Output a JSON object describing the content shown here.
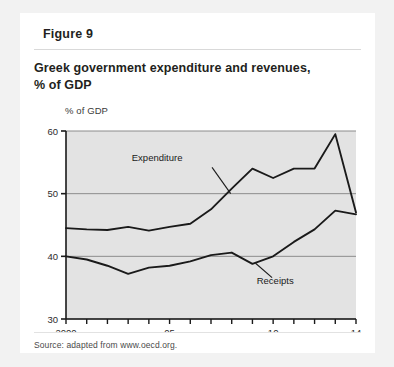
{
  "figure": {
    "tab_label": "Figure 9",
    "title_line1": "Greek government expenditure and revenues,",
    "title_line2": "% of GDP",
    "source": "Source: adapted from www.oecd.org."
  },
  "chart_data": {
    "type": "line",
    "title": "Greek government expenditure and revenues, % of GDP",
    "ylabel": "% of GDP",
    "xlabel": "",
    "ylim": [
      30,
      60
    ],
    "yticks": [
      30,
      40,
      50,
      60
    ],
    "ytick_labels": [
      "30",
      "40",
      "50",
      "60"
    ],
    "xlim": [
      2000,
      2014
    ],
    "xticks": [
      2000,
      2001,
      2002,
      2003,
      2004,
      2005,
      2006,
      2007,
      2008,
      2009,
      2010,
      2011,
      2012,
      2013,
      2014
    ],
    "xtick_labels": [
      "2000",
      "",
      "",
      "",
      "",
      "05",
      "",
      "",
      "",
      "",
      "10",
      "",
      "",
      "",
      "14"
    ],
    "x": [
      2000,
      2001,
      2002,
      2003,
      2004,
      2005,
      2006,
      2007,
      2008,
      2009,
      2010,
      2011,
      2012,
      2013,
      2014
    ],
    "grid": "horizontal",
    "legend": "inline-annotations",
    "series": [
      {
        "name": "Expenditure",
        "color": "#1a1a1a",
        "values": [
          44.5,
          44.3,
          44.2,
          44.7,
          44.1,
          44.7,
          45.2,
          47.5,
          50.8,
          54.0,
          52.5,
          54.0,
          54.0,
          59.5,
          47.0
        ]
      },
      {
        "name": "Receipts",
        "color": "#1a1a1a",
        "values": [
          40.0,
          39.5,
          38.5,
          37.2,
          38.2,
          38.5,
          39.2,
          40.2,
          40.6,
          38.8,
          40.0,
          42.3,
          44.3,
          47.3,
          46.7
        ]
      }
    ],
    "annotations": [
      {
        "text": "Expenditure",
        "x": 2004.4,
        "y": 55.2
      },
      {
        "text": "Receipts",
        "x": 2010.1,
        "y": 35.6
      }
    ]
  },
  "colors": {
    "page_background": "#f2f2f2",
    "card_background": "#ffffff",
    "plot_background": "#e3e3e3",
    "line": "#1a1a1a",
    "gridline": "#8c8c8c",
    "axis": "#1a1a1a",
    "text": "#231f20"
  }
}
